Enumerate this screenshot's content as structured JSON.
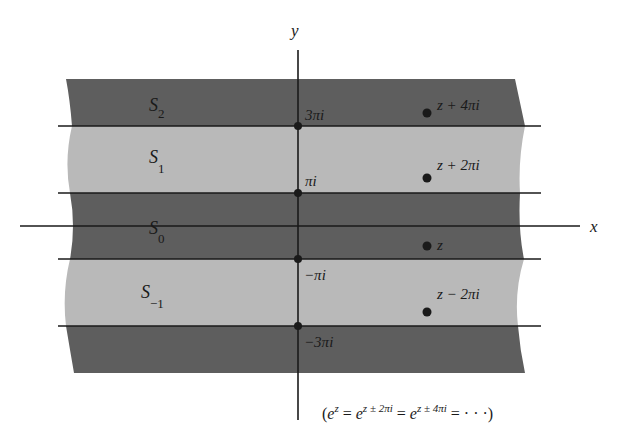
{
  "figure": {
    "colors": {
      "dark_strip": "#5e5e5e",
      "light_strip": "#b9b9b9",
      "line": "#1a1a1a",
      "background": "#ffffff"
    },
    "axes": {
      "x_label": "x",
      "y_label": "y"
    },
    "strips": [
      {
        "name": "S_2",
        "label_main": "S",
        "label_sub": "2",
        "shade": "dark"
      },
      {
        "name": "S_1",
        "label_main": "S",
        "label_sub": "1",
        "shade": "light"
      },
      {
        "name": "S_0",
        "label_main": "S",
        "label_sub": "0",
        "shade": "dark"
      },
      {
        "name": "S_-1",
        "label_main": "S",
        "label_sub": "−1",
        "shade": "light"
      },
      {
        "name": "S_-2",
        "label_main": "",
        "label_sub": "",
        "shade": "dark"
      }
    ],
    "y_ticks": [
      {
        "label": "3πi",
        "value": "3πi"
      },
      {
        "label": "πi",
        "value": "πi"
      },
      {
        "label": "−πi",
        "value": "−πi"
      },
      {
        "label": "−3πi",
        "value": "−3πi"
      }
    ],
    "points": [
      {
        "label": "z + 4πi"
      },
      {
        "label": "z + 2πi"
      },
      {
        "label": "z"
      },
      {
        "label": "z − 2πi"
      }
    ],
    "caption": {
      "open": "(",
      "e1": "e",
      "sup1": "z",
      "eq1": " = ",
      "e2": "e",
      "sup2": "z ± 2πi",
      "eq2": " = ",
      "e3": "e",
      "sup3": "z ± 4πi",
      "eq3": " = · · ·",
      "close": ")"
    }
  }
}
